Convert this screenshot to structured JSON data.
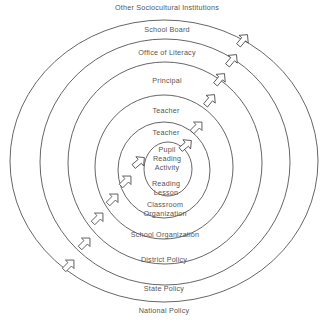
{
  "diagram": {
    "type": "concentric-ellipses",
    "rings_outer_to_inner": [
      {
        "outside_label": "Other Sociocultural Institutions",
        "inside_top_label": "School Board",
        "inside_bottom_label": "State Policy",
        "below_label": "National Policy"
      },
      {
        "inside_top_label": "Office of Literacy",
        "inside_bottom_label": "District Policy"
      },
      {
        "inside_top_label": "Principal",
        "inside_bottom_label": "School Organization"
      },
      {
        "inside_top_label": "Teacher",
        "inside_bottom_label": "Classroom Organization"
      },
      {
        "inside_top_label": "Teacher",
        "inside_bottom_label": "Reading Lesson"
      },
      {
        "center_label": "Pupil Reading Activity"
      }
    ],
    "labels": {
      "outer_top": "Other Sociocultural Institutions",
      "school_board": "School Board",
      "office_of_literacy": "Office of Literacy",
      "principal": "Principal",
      "teacher_outer": "Teacher",
      "teacher_inner": "Teacher",
      "pupil_line1": "Pupil",
      "pupil_line2": "Reading",
      "pupil_line3": "Activity",
      "reading_line1": "Reading",
      "reading_line2": "Lesson",
      "classroom_line1": "Classroom",
      "classroom_line2": "Organization",
      "school_organization": "School Organization",
      "district_policy": "District Policy",
      "state_policy": "State Policy",
      "national_policy": "National Policy"
    },
    "arrows": {
      "direction": "outward (lower-left to upper-right)",
      "count_right_side": 6,
      "count_left_side": 6
    },
    "colors": {
      "line": "#555555",
      "text": "#555555",
      "background": "#ffffff"
    }
  }
}
